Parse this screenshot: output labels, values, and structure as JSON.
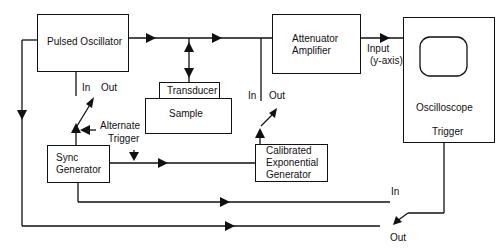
{
  "diagram": {
    "type": "block-diagram",
    "blocks": {
      "pulsed_oscillator": "Pulsed Oscillator",
      "transducer": "Transducer",
      "sample": "Sample",
      "attenuator_line1": "Attenuator",
      "attenuator_line2": "Amplifier",
      "oscilloscope": "Oscilloscope",
      "oscilloscope_trigger": "Trigger",
      "sync_line1": "Sync",
      "sync_line2": "Generator",
      "calexp_line1": "Calibrated",
      "calexp_line2": "Exponential",
      "calexp_line3": "Generator"
    },
    "labels": {
      "po_in": "In",
      "po_out": "Out",
      "alt_trigger_line1": "Alternate",
      "alt_trigger_line2": "Trigger",
      "att_in": "In",
      "att_out": "Out",
      "input_line1": "Input",
      "input_line2": "(y-axis)",
      "trig_in": "In",
      "trig_out": "Out"
    },
    "colors": {
      "line": "#111111",
      "background": "#ffffff"
    }
  }
}
